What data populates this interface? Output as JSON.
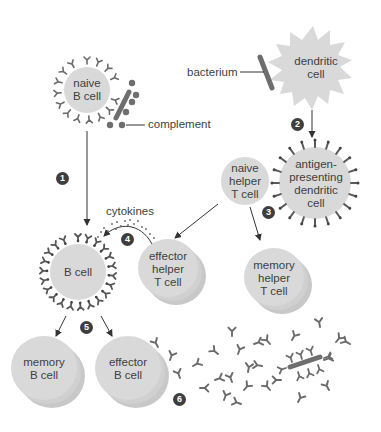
{
  "diagram": {
    "title": "",
    "colors": {
      "cell_fill": "#d9d9d9",
      "cell_shadow": "#c8c8c8",
      "receptor": "#6a6a6a",
      "bacterium": "#6e6e6e",
      "step_badge": "#3e3e3e",
      "arrow": "#333333",
      "background": "#ffffff"
    },
    "nodes": {
      "naive_b_cell": {
        "line1": "naive",
        "line2": "B cell"
      },
      "complement": {
        "label": "complement"
      },
      "bacterium": {
        "label": "bacterium"
      },
      "dendritic_cell": {
        "line1": "dendritic",
        "line2": "cell"
      },
      "apc": {
        "line1": "antigen-",
        "line2": "presenting",
        "line3": "dendritic",
        "line4": "cell"
      },
      "naive_helper_t": {
        "line1": "naive",
        "line2": "helper",
        "line3": "T cell"
      },
      "cytokines": {
        "label": "cytokines"
      },
      "b_cell": {
        "label": "B cell"
      },
      "effector_helper_t": {
        "line1": "effector",
        "line2": "helper",
        "line3": "T cell"
      },
      "memory_helper_t": {
        "line1": "memory",
        "line2": "helper",
        "line3": "T cell"
      },
      "memory_b_cell": {
        "line1": "memory",
        "line2": "B cell"
      },
      "effector_b_cell": {
        "line1": "effector",
        "line2": "B cell"
      }
    },
    "steps": [
      "1",
      "2",
      "3",
      "4",
      "5",
      "6"
    ],
    "edges": [
      {
        "from": "naive_b_cell",
        "to": "b_cell",
        "step": "1"
      },
      {
        "from": "dendritic_cell",
        "to": "apc",
        "step": "2"
      },
      {
        "from": "apc",
        "to": "naive_helper_t",
        "step": "3"
      },
      {
        "from": "naive_helper_t",
        "to": "effector_helper_t"
      },
      {
        "from": "naive_helper_t",
        "to": "memory_helper_t"
      },
      {
        "from": "effector_helper_t",
        "to": "b_cell",
        "label": "cytokines",
        "step": "4"
      },
      {
        "from": "b_cell",
        "to": "memory_b_cell",
        "step": "5"
      },
      {
        "from": "b_cell",
        "to": "effector_b_cell",
        "step": "5"
      },
      {
        "from": "effector_b_cell",
        "to": "antibodies",
        "step": "6"
      }
    ]
  }
}
